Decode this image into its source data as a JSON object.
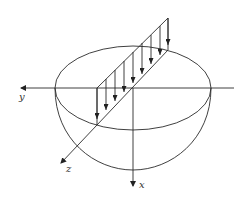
{
  "figure": {
    "line_color": "#2a2a2a",
    "axes": {
      "y": {
        "label": "y"
      },
      "z": {
        "label": "z"
      },
      "x": {
        "label": "x"
      }
    },
    "load": {
      "arrow_count": 8
    }
  }
}
